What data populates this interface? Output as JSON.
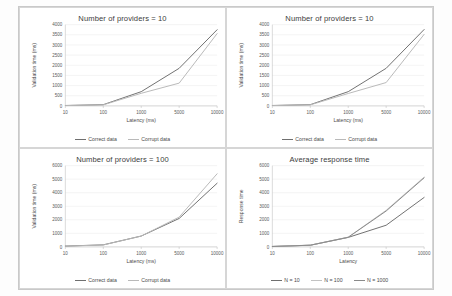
{
  "figure": {
    "panel_count": 4
  },
  "chart_data": [
    {
      "id": "providers-10-a",
      "type": "line",
      "title": "Number of providers = 10",
      "xlabel": "Latency (ms)",
      "ylabel": "Validation time (ms)",
      "categories": [
        "10",
        "100",
        "1000",
        "5000",
        "10000"
      ],
      "xticks": [
        "10",
        "100",
        "1000",
        "5000",
        "10000"
      ],
      "yticks": [
        "0",
        "500",
        "1000",
        "1500",
        "2000",
        "2500",
        "3000",
        "3500",
        "4000"
      ],
      "ylim": [
        0,
        4000
      ],
      "grid": true,
      "legend_position": "bottom",
      "series": [
        {
          "name": "Correct data",
          "color": "#6f6f6f",
          "values": [
            20,
            60,
            700,
            1850,
            3750
          ]
        },
        {
          "name": "Corrupt data",
          "color": "#b9b9b9",
          "values": [
            15,
            50,
            620,
            1120,
            3560
          ]
        }
      ]
    },
    {
      "id": "providers-10-b",
      "type": "line",
      "title": "Number of providers = 10",
      "xlabel": "Latency (ms)",
      "ylabel": "Validation time (ms)",
      "categories": [
        "10",
        "100",
        "1000",
        "5000",
        "10000"
      ],
      "xticks": [
        "10",
        "100",
        "1000",
        "5000",
        "10000"
      ],
      "yticks": [
        "0",
        "500",
        "1000",
        "1500",
        "2000",
        "2500",
        "3000",
        "3500",
        "4000"
      ],
      "ylim": [
        0,
        4000
      ],
      "grid": true,
      "legend_position": "bottom",
      "series": [
        {
          "name": "Correct data",
          "color": "#6f6f6f",
          "values": [
            20,
            60,
            700,
            1850,
            3760
          ]
        },
        {
          "name": "Corrupt data",
          "color": "#b9b9b9",
          "values": [
            15,
            50,
            610,
            1150,
            3520
          ]
        }
      ]
    },
    {
      "id": "providers-100",
      "type": "line",
      "title": "Number of providers = 100",
      "xlabel": "Latency (ms)",
      "ylabel": "Validation time (ms)",
      "categories": [
        "10",
        "100",
        "1000",
        "5000",
        "10000"
      ],
      "xticks": [
        "10",
        "100",
        "1000",
        "5000",
        "10000"
      ],
      "yticks": [
        "0",
        "1000",
        "2000",
        "3000",
        "4000",
        "5000",
        "6000"
      ],
      "ylim": [
        0,
        6000
      ],
      "grid": true,
      "legend_position": "bottom",
      "series": [
        {
          "name": "Correct data",
          "color": "#6f6f6f",
          "values": [
            60,
            150,
            800,
            2100,
            4700
          ]
        },
        {
          "name": "Corrupt data",
          "color": "#b9b9b9",
          "values": [
            55,
            140,
            800,
            2200,
            5400
          ]
        }
      ]
    },
    {
      "id": "average-response-time",
      "type": "line",
      "title": "Average response time",
      "xlabel": "Latency",
      "ylabel": "Response time",
      "categories": [
        "10",
        "100",
        "1000",
        "5000",
        "10000"
      ],
      "xticks": [
        "10",
        "100",
        "1000",
        "5000",
        "10000"
      ],
      "yticks": [
        "0",
        "1000",
        "2000",
        "3000",
        "4000",
        "5000",
        "6000"
      ],
      "ylim": [
        0,
        6000
      ],
      "grid": true,
      "legend_position": "bottom",
      "series": [
        {
          "name": "N = 10",
          "color": "#6f6f6f",
          "values": [
            30,
            120,
            700,
            1600,
            3650
          ]
        },
        {
          "name": "N = 100",
          "color": "#c2c2c2",
          "values": [
            35,
            130,
            720,
            2700,
            5150
          ]
        },
        {
          "name": "N = 1000",
          "color": "#8a8a8a",
          "values": [
            30,
            125,
            710,
            2650,
            5100
          ]
        }
      ]
    }
  ]
}
